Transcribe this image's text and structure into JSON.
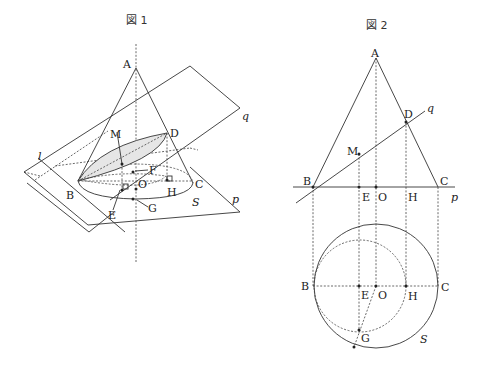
{
  "figure1": {
    "title": "図 1",
    "labels": {
      "A": "A",
      "M": "M",
      "D": "D",
      "F": "F",
      "O": "O",
      "B": "B",
      "C": "C",
      "H": "H",
      "E": "E",
      "G": "G",
      "S": "S",
      "l": "l",
      "p": "p",
      "q": "q"
    }
  },
  "figure2": {
    "title": "図 2",
    "labels": {
      "A": "A",
      "D": "D",
      "M": "M",
      "B": "B",
      "E": "E",
      "O": "O",
      "H": "H",
      "C": "C",
      "G": "G",
      "S": "S",
      "p": "p",
      "q": "q",
      "B2": "B",
      "E2": "E",
      "O2": "O",
      "H2": "H",
      "C2": "C"
    }
  },
  "colors": {
    "stroke": "#333333",
    "ellipse_fill": "#e6e6e6",
    "background": "#ffffff"
  }
}
